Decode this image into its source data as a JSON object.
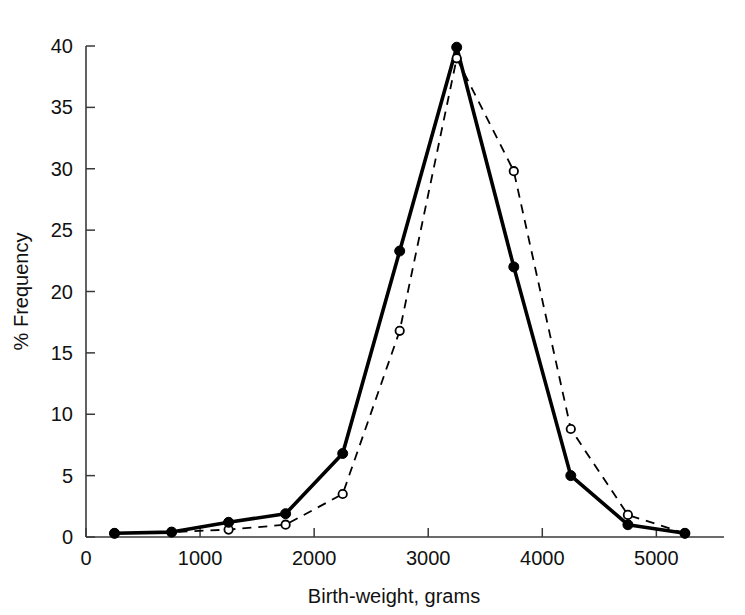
{
  "chart_data": {
    "type": "line",
    "title": "",
    "xlabel": "Birth-weight, grams",
    "ylabel": "% Frequency",
    "xlim": [
      0,
      5400
    ],
    "ylim": [
      0,
      40
    ],
    "xticks": [
      0,
      1000,
      2000,
      3000,
      4000,
      5000
    ],
    "xticklabels": [
      "0",
      "1000",
      "2000",
      "3000",
      "4000",
      "5000"
    ],
    "yticks": [
      0,
      5,
      10,
      15,
      20,
      25,
      30,
      35,
      40
    ],
    "yticklabels": [
      "0",
      "5",
      "10",
      "15",
      "20",
      "25",
      "30",
      "35",
      "40"
    ],
    "grid": false,
    "legend": "none",
    "x": [
      250,
      750,
      1250,
      1750,
      2250,
      2750,
      3250,
      3750,
      4250,
      4750,
      5250
    ],
    "series": [
      {
        "name": "solid-filled-circle-series",
        "style": "solid",
        "marker": "filled-circle",
        "color": "#000000",
        "values": [
          0.3,
          0.4,
          1.2,
          1.9,
          6.8,
          23.3,
          39.9,
          22.0,
          5.0,
          1.0,
          0.3
        ]
      },
      {
        "name": "dashed-open-circle-series",
        "style": "dashed",
        "marker": "open-circle",
        "color": "#000000",
        "values": [
          0.3,
          0.4,
          0.6,
          1.0,
          3.5,
          16.8,
          39.0,
          29.8,
          8.8,
          1.8,
          0.3
        ]
      }
    ]
  }
}
